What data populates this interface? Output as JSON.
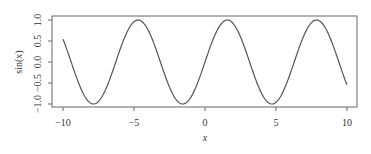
{
  "chart_data": {
    "type": "line",
    "title": "",
    "xlabel": "x",
    "ylabel": "sin(x)",
    "xlim": [
      -10.8,
      10.7
    ],
    "ylim": [
      -1.07,
      1.1
    ],
    "grid": false,
    "legend": null,
    "x_ticks": [
      -10,
      -5,
      0,
      5,
      10
    ],
    "x_tick_labels": [
      "−10",
      "−5",
      "0",
      "5",
      "10"
    ],
    "y_ticks": [
      -1.0,
      -0.5,
      0.0,
      0.5,
      1.0
    ],
    "y_tick_labels": [
      "−1.0",
      "−0.5",
      "0.0",
      "0.5",
      "1.0"
    ],
    "series": [
      {
        "name": "sin(x)",
        "function": "sin(x)",
        "x_range": [
          -10,
          10
        ],
        "color": "#555555",
        "x": [
          -10,
          -9,
          -8,
          -7,
          -6,
          -5,
          -4,
          -3,
          -2,
          -1,
          0,
          1,
          2,
          3,
          4,
          5,
          6,
          7,
          8,
          9,
          10
        ],
        "values": [
          0.544,
          -0.412,
          -0.989,
          -0.657,
          0.279,
          0.959,
          0.757,
          -0.141,
          -0.909,
          -0.841,
          0.0,
          0.841,
          0.909,
          0.141,
          -0.757,
          -0.959,
          -0.279,
          0.657,
          0.989,
          0.412,
          -0.544
        ]
      }
    ]
  },
  "colors": {
    "line": "#555555",
    "frame": "#666666",
    "text": "#333333"
  }
}
